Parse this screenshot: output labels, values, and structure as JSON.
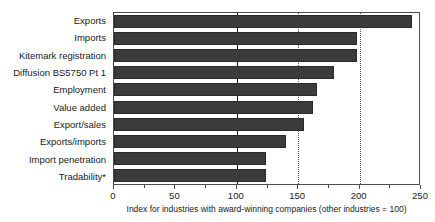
{
  "chart_data": {
    "type": "bar",
    "orientation": "horizontal",
    "title": "",
    "subtitle": "",
    "xlabel": "Index for industries with award-winning companies (other industries = 100)",
    "ylabel": "",
    "xlim": [
      0,
      250
    ],
    "xticks": [
      0,
      50,
      100,
      150,
      200,
      250
    ],
    "xtick_labels": [
      "0",
      "50",
      "100",
      "150",
      "200",
      "250"
    ],
    "minor_xticks": [
      25,
      75,
      125,
      175,
      225
    ],
    "grid": "vertical reference lines at 100 (solid), 150 (dotted), 200 (dotted)",
    "reference_lines": [
      {
        "value": 100,
        "style": "solid"
      },
      {
        "value": 150,
        "style": "dotted"
      },
      {
        "value": 200,
        "style": "dotted"
      }
    ],
    "legend": "none",
    "bar_color": "#3b3b3b",
    "categories": [
      "Exports",
      "Imports",
      "Kitemark registration",
      "Diffusion BS5750 Pt 1",
      "Employment",
      "Value added",
      "Export/sales",
      "Exports/imports",
      "Import penetration",
      "Tradability*"
    ],
    "values": [
      243,
      198,
      198,
      179,
      165,
      162,
      155,
      140,
      124,
      124
    ],
    "footnote_marker": "*"
  },
  "axis": {
    "caption": "Index for industries with award-winning companies (other industries = 100)"
  }
}
